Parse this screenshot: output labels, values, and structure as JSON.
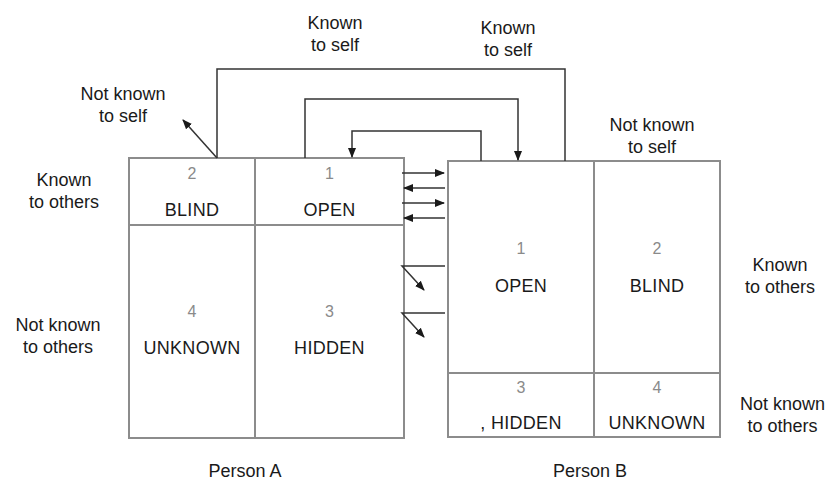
{
  "diagram": {
    "type": "johari-window-interaction",
    "colors": {
      "line": "#555555",
      "grid": "#8c8c8c",
      "number": "#8a8a8a",
      "text": "#1a1a1a"
    },
    "top_labels": {
      "person_a_known_to_self": "Known\nto self",
      "person_b_known_to_self": "Known\nto self",
      "person_a_not_known_to_self": "Not known\nto self",
      "person_b_not_known_to_self": "Not known\nto self"
    },
    "side_labels": {
      "person_a_known_to_others": "Known\nto others",
      "person_a_not_known_to_others": "Not known\nto others",
      "person_b_known_to_others": "Known\nto others",
      "person_b_not_known_to_others": "Not known\nto others"
    },
    "person_a": {
      "caption": "Person A",
      "cells": [
        {
          "number": "2",
          "name": "BLIND"
        },
        {
          "number": "1",
          "name": "OPEN"
        },
        {
          "number": "4",
          "name": "UNKNOWN"
        },
        {
          "number": "3",
          "name": "HIDDEN"
        }
      ]
    },
    "person_b": {
      "caption": "Person B",
      "cells": [
        {
          "number": "1",
          "name": "OPEN"
        },
        {
          "number": "2",
          "name": "BLIND"
        },
        {
          "number": "3",
          "name": ", HIDDEN"
        },
        {
          "number": "4",
          "name": "UNKNOWN"
        }
      ]
    }
  }
}
